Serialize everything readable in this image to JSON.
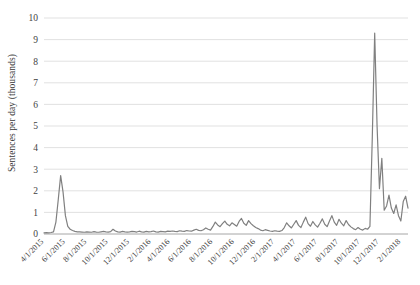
{
  "chart_data": {
    "type": "line",
    "title": "",
    "subtitle": "",
    "xlabel": "",
    "ylabel": "Sentences per day (thousands)",
    "ylim": [
      0,
      10
    ],
    "ytick_labels": [
      "0",
      "1",
      "2",
      "3",
      "4",
      "5",
      "6",
      "7",
      "8",
      "9",
      "10"
    ],
    "ytick_values": [
      0,
      1,
      2,
      3,
      4,
      5,
      6,
      7,
      8,
      9,
      10
    ],
    "grid": true,
    "grid_axis": "y",
    "legend": false,
    "legend_position": "none",
    "line_color": "#808080",
    "grid_color": "#d9d9d9",
    "axis_color": "#a6a6a6",
    "x_start": "4/1/2015",
    "x_end": "2/1/2018",
    "xtick_labels": [
      "4/1/2015",
      "6/1/2015",
      "8/1/2015",
      "10/1/2015",
      "12/1/2015",
      "2/1/2016",
      "4/1/2016",
      "6/1/2016",
      "8/1/2016",
      "10/1/2016",
      "12/1/2016",
      "2/1/2017",
      "4/1/2017",
      "6/1/2017",
      "8/1/2017",
      "10/1/2017",
      "12/1/2017",
      "2/1/2018"
    ],
    "xtick_index": [
      0,
      9,
      18,
      27,
      36,
      45,
      53,
      62,
      71,
      80,
      89,
      97,
      106,
      115,
      124,
      133,
      141,
      150
    ],
    "series": [
      {
        "name": "Sentences per day (thousands)",
        "values": [
          0.05,
          0.06,
          0.05,
          0.07,
          0.1,
          0.55,
          1.6,
          2.7,
          1.95,
          0.85,
          0.35,
          0.22,
          0.16,
          0.12,
          0.1,
          0.1,
          0.09,
          0.08,
          0.1,
          0.09,
          0.08,
          0.11,
          0.09,
          0.08,
          0.1,
          0.12,
          0.1,
          0.09,
          0.11,
          0.22,
          0.14,
          0.1,
          0.09,
          0.12,
          0.1,
          0.09,
          0.1,
          0.12,
          0.11,
          0.09,
          0.13,
          0.1,
          0.09,
          0.12,
          0.1,
          0.11,
          0.14,
          0.1,
          0.09,
          0.12,
          0.11,
          0.1,
          0.13,
          0.12,
          0.14,
          0.12,
          0.11,
          0.15,
          0.13,
          0.12,
          0.16,
          0.14,
          0.13,
          0.18,
          0.22,
          0.17,
          0.15,
          0.2,
          0.28,
          0.22,
          0.18,
          0.35,
          0.55,
          0.42,
          0.34,
          0.48,
          0.6,
          0.45,
          0.38,
          0.52,
          0.44,
          0.36,
          0.58,
          0.72,
          0.5,
          0.4,
          0.62,
          0.48,
          0.38,
          0.3,
          0.25,
          0.18,
          0.15,
          0.2,
          0.17,
          0.14,
          0.12,
          0.15,
          0.13,
          0.12,
          0.16,
          0.3,
          0.52,
          0.38,
          0.28,
          0.45,
          0.62,
          0.4,
          0.3,
          0.55,
          0.78,
          0.48,
          0.36,
          0.58,
          0.42,
          0.32,
          0.5,
          0.7,
          0.45,
          0.34,
          0.6,
          0.85,
          0.55,
          0.4,
          0.68,
          0.5,
          0.38,
          0.62,
          0.44,
          0.33,
          0.25,
          0.2,
          0.3,
          0.22,
          0.18,
          0.26,
          0.22,
          0.35,
          4.5,
          9.3,
          5.0,
          2.1,
          3.5,
          1.1,
          1.3,
          1.8,
          1.2,
          0.95,
          1.35,
          0.85,
          0.6,
          1.5,
          1.75,
          1.2
        ]
      }
    ],
    "annotations": [
      {
        "label": "initial spike",
        "x_approx": "6/1/2015",
        "y": 2.7
      },
      {
        "label": "main spike",
        "x_approx": "11/1/2017",
        "y": 9.3
      },
      {
        "label": "secondary spike",
        "x_approx": "11/15/2017",
        "y": 3.5
      }
    ]
  }
}
